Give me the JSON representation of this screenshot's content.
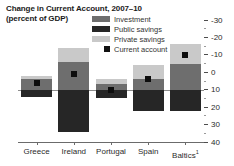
{
  "header": {
    "title": "Change in Current Account, 2007–10",
    "subtitle": "(percent of GDP)"
  },
  "legend": {
    "position": "top-right",
    "items": [
      {
        "label": "Investment",
        "icon": "square-swatch-icon",
        "color": "#6e6e6e",
        "type": "swatch"
      },
      {
        "label": "Public savings",
        "icon": "square-swatch-icon",
        "color": "#262626",
        "type": "swatch"
      },
      {
        "label": "Private savings",
        "icon": "square-swatch-icon",
        "color": "#c9c9c9",
        "type": "swatch"
      },
      {
        "label": "Current account",
        "icon": "square-marker-icon",
        "color": "#0d0d0d",
        "type": "marker"
      }
    ]
  },
  "axis": {
    "y_ticks": [
      "40",
      "30",
      "20",
      "10",
      "0",
      "-10",
      "-20",
      "-30"
    ],
    "x_labels": [
      "Greece",
      "Ireland",
      "Portugal",
      "Spain",
      "Baltics"
    ],
    "baltics_footnote": "1"
  },
  "chart_data": {
    "type": "bar",
    "title": "Change in Current Account, 2007–10",
    "subtitle": "(percent of GDP)",
    "xlabel": "",
    "ylabel": "percent of GDP",
    "ylim": [
      -30,
      40
    ],
    "y_ticks": [
      -30,
      -20,
      -10,
      0,
      10,
      20,
      30,
      40
    ],
    "y_minor_ticks": [
      -25,
      -15,
      -5,
      5,
      15,
      25,
      35
    ],
    "grid": false,
    "zero_line": true,
    "legend_position": "top-right",
    "stacked": true,
    "categories": [
      "Greece",
      "Ireland",
      "Portugal",
      "Spain",
      "Baltics"
    ],
    "series": [
      {
        "name": "Private savings",
        "color": "#c9c9c9",
        "values": [
          2,
          8,
          2.5,
          8,
          11
        ]
      },
      {
        "name": "Investment",
        "color": "#6e6e6e",
        "values": [
          6,
          16,
          3.5,
          6,
          15
        ]
      },
      {
        "name": "Public savings",
        "color": "#262626",
        "values": [
          -4,
          -24,
          -4.5,
          -12,
          -12
        ]
      }
    ],
    "markers": {
      "name": "Current account",
      "color": "#0d0d0d",
      "values": [
        4,
        9,
        0,
        6,
        20
      ]
    },
    "footnotes": [
      "1 Baltics"
    ]
  }
}
